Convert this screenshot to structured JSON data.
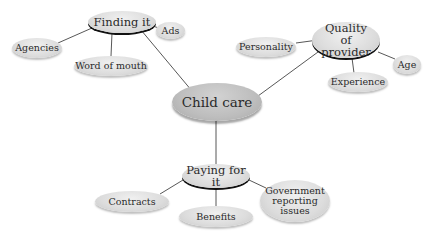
{
  "diagram": {
    "type": "mind-map",
    "center": {
      "label": "Child care"
    },
    "branches": [
      {
        "label": "Finding it",
        "children": [
          {
            "label": "Ads"
          },
          {
            "label": "Agencies"
          },
          {
            "label": "Word of mouth"
          }
        ]
      },
      {
        "label": "Quality of provider",
        "children": [
          {
            "label": "Personality"
          },
          {
            "label": "Age"
          },
          {
            "label": "Experience"
          }
        ]
      },
      {
        "label": "Paying for it",
        "children": [
          {
            "label": "Contracts"
          },
          {
            "label": "Benefits"
          },
          {
            "label": "Government reporting issues"
          }
        ]
      }
    ]
  },
  "colors": {
    "node_fill": "#dcdcdc",
    "center_fill": "#bdbdbd",
    "connector": "#444444",
    "main_shadow": "#111111"
  }
}
